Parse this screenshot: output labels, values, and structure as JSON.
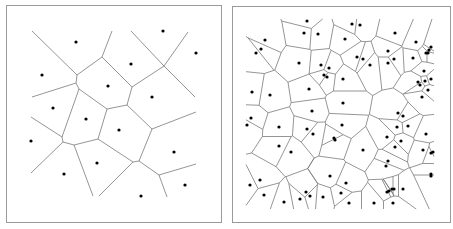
{
  "figure": {
    "colors": {
      "edge": "#7a7a7a",
      "site": "#000000",
      "frame": "#9a9a9a",
      "background": "#ffffff"
    }
  },
  "left_panel": {
    "sites": [
      [
        76,
        42
      ],
      [
        163,
        31
      ],
      [
        196,
        53
      ],
      [
        42,
        75
      ],
      [
        131,
        64
      ],
      [
        108,
        86
      ],
      [
        152,
        97
      ],
      [
        53,
        108
      ],
      [
        86,
        119
      ],
      [
        119,
        130
      ],
      [
        31,
        141
      ],
      [
        174,
        152
      ],
      [
        97,
        163
      ],
      [
        64,
        174
      ],
      [
        185,
        185
      ],
      [
        141,
        196
      ]
    ],
    "edges": [
      [
        [
          32,
          31
        ],
        [
          77,
          75
        ]
      ],
      [
        [
          112,
          31
        ],
        [
          102,
          57
        ]
      ],
      [
        [
          102,
          57
        ],
        [
          77,
          75
        ]
      ],
      [
        [
          77,
          75
        ],
        [
          76,
          83
        ]
      ],
      [
        [
          76,
          83
        ],
        [
          32,
          97
        ]
      ],
      [
        [
          76,
          83
        ],
        [
          79,
          89
        ]
      ],
      [
        [
          79,
          89
        ],
        [
          107,
          109
        ]
      ],
      [
        [
          79,
          89
        ],
        [
          62,
          137
        ]
      ],
      [
        [
          102,
          57
        ],
        [
          132,
          87
        ]
      ],
      [
        [
          132,
          87
        ],
        [
          127,
          105
        ]
      ],
      [
        [
          127,
          105
        ],
        [
          107,
          109
        ]
      ],
      [
        [
          107,
          109
        ],
        [
          98,
          139
        ]
      ],
      [
        [
          132,
          87
        ],
        [
          164,
          66
        ]
      ],
      [
        [
          131,
          31
        ],
        [
          164,
          66
        ]
      ],
      [
        [
          164,
          66
        ],
        [
          188,
          32
        ]
      ],
      [
        [
          164,
          66
        ],
        [
          195,
          97
        ]
      ],
      [
        [
          127,
          105
        ],
        [
          152,
          129
        ]
      ],
      [
        [
          152,
          129
        ],
        [
          196,
          112
        ]
      ],
      [
        [
          152,
          129
        ],
        [
          139,
          161
        ]
      ],
      [
        [
          62,
          137
        ],
        [
          31,
          117
        ]
      ],
      [
        [
          62,
          137
        ],
        [
          63,
          142
        ]
      ],
      [
        [
          63,
          142
        ],
        [
          31,
          173
        ]
      ],
      [
        [
          63,
          142
        ],
        [
          74,
          145
        ]
      ],
      [
        [
          74,
          145
        ],
        [
          98,
          139
        ]
      ],
      [
        [
          74,
          145
        ],
        [
          93,
          196
        ]
      ],
      [
        [
          98,
          139
        ],
        [
          133,
          162
        ]
      ],
      [
        [
          133,
          162
        ],
        [
          139,
          161
        ]
      ],
      [
        [
          133,
          162
        ],
        [
          99,
          196
        ]
      ],
      [
        [
          139,
          161
        ],
        [
          159,
          175
        ]
      ],
      [
        [
          159,
          175
        ],
        [
          196,
          164
        ]
      ],
      [
        [
          159,
          175
        ],
        [
          167,
          197
        ]
      ]
    ]
  },
  "right_panel": {
    "clip_box": [
      246,
      19,
      434,
      209
    ],
    "sites": [
      [
        307,
        21
      ],
      [
        304,
        33
      ],
      [
        318,
        34
      ],
      [
        352,
        24
      ],
      [
        360,
        25
      ],
      [
        265,
        40
      ],
      [
        261,
        49
      ],
      [
        256,
        53
      ],
      [
        345,
        39
      ],
      [
        395,
        33
      ],
      [
        416,
        42
      ],
      [
        429,
        50
      ],
      [
        428,
        53
      ],
      [
        426,
        53
      ],
      [
        431,
        47
      ],
      [
        299,
        63
      ],
      [
        321,
        65
      ],
      [
        329,
        68
      ],
      [
        324,
        75
      ],
      [
        327,
        77
      ],
      [
        357,
        57
      ],
      [
        363,
        59
      ],
      [
        370,
        65
      ],
      [
        388,
        51
      ],
      [
        388,
        63
      ],
      [
        394,
        59
      ],
      [
        413,
        58
      ],
      [
        424,
        71
      ],
      [
        418,
        82
      ],
      [
        420,
        85
      ],
      [
        431,
        79
      ],
      [
        425,
        81
      ],
      [
        428,
        90
      ],
      [
        422,
        97
      ],
      [
        252,
        92
      ],
      [
        270,
        95
      ],
      [
        309,
        89
      ],
      [
        343,
        79
      ],
      [
        343,
        103
      ],
      [
        251,
        118
      ],
      [
        247,
        125
      ],
      [
        312,
        111
      ],
      [
        279,
        127
      ],
      [
        307,
        129
      ],
      [
        313,
        134
      ],
      [
        342,
        125
      ],
      [
        334,
        138
      ],
      [
        335,
        140
      ],
      [
        398,
        113
      ],
      [
        403,
        116
      ],
      [
        408,
        126
      ],
      [
        397,
        127
      ],
      [
        426,
        134
      ],
      [
        387,
        137
      ],
      [
        401,
        141
      ],
      [
        395,
        147
      ],
      [
        279,
        146
      ],
      [
        291,
        152
      ],
      [
        363,
        150
      ],
      [
        423,
        150
      ],
      [
        431,
        153
      ],
      [
        433,
        152
      ],
      [
        388,
        161
      ],
      [
        386,
        166
      ],
      [
        431,
        174
      ],
      [
        431,
        176
      ],
      [
        330,
        176
      ],
      [
        260,
        180
      ],
      [
        250,
        185
      ],
      [
        346,
        183
      ],
      [
        387,
        192
      ],
      [
        389,
        191
      ],
      [
        392,
        189
      ],
      [
        394,
        189
      ],
      [
        403,
        189
      ],
      [
        306,
        192
      ],
      [
        310,
        196
      ],
      [
        323,
        197
      ],
      [
        341,
        193
      ],
      [
        264,
        195
      ],
      [
        284,
        202
      ],
      [
        300,
        199
      ],
      [
        349,
        203
      ],
      [
        374,
        203
      ],
      [
        393,
        203
      ]
    ]
  }
}
